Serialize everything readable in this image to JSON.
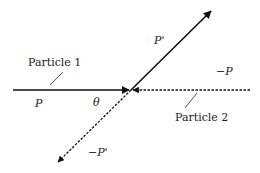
{
  "diagram": {
    "labels": {
      "particle1": "Particle 1",
      "particle2": "Particle 2",
      "p": "P",
      "p_prime": "P'",
      "neg_p": "−P",
      "neg_p_prime": "−P'",
      "theta": "θ"
    },
    "colors": {
      "line": "#111111",
      "text": "#222222",
      "background": "#ffffff"
    },
    "vectors": [
      {
        "name": "P",
        "style": "solid",
        "from": [
          13,
          90
        ],
        "to": [
          131,
          90
        ]
      },
      {
        "name": "-P",
        "style": "dashed",
        "from": [
          250,
          90
        ],
        "to": [
          131,
          90
        ]
      },
      {
        "name": "P'",
        "style": "solid",
        "from": [
          131,
          90
        ],
        "to": [
          212,
          10
        ]
      },
      {
        "name": "-P'",
        "style": "dashed",
        "from": [
          131,
          90
        ],
        "to": [
          57,
          163
        ]
      }
    ]
  }
}
